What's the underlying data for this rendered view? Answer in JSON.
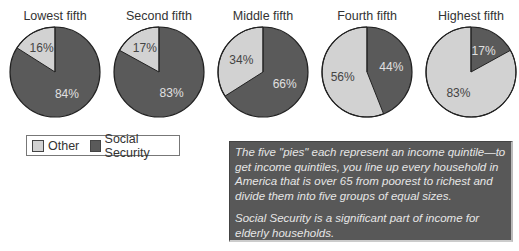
{
  "chart_data": {
    "type": "pie",
    "charts": [
      {
        "title": "Lowest fifth",
        "slices": [
          {
            "label": "Other",
            "value": 16
          },
          {
            "label": "Social Security",
            "value": 84
          }
        ]
      },
      {
        "title": "Second fifth",
        "slices": [
          {
            "label": "Other",
            "value": 17
          },
          {
            "label": "Social Security",
            "value": 83
          }
        ]
      },
      {
        "title": "Middle fifth",
        "slices": [
          {
            "label": "Other",
            "value": 34
          },
          {
            "label": "Social Security",
            "value": 66
          }
        ]
      },
      {
        "title": "Fourth fifth",
        "slices": [
          {
            "label": "Other",
            "value": 56
          },
          {
            "label": "Social Security",
            "value": 44
          }
        ]
      },
      {
        "title": "Highest fifth",
        "slices": [
          {
            "label": "Other",
            "value": 83
          },
          {
            "label": "Social Security",
            "value": 17
          }
        ]
      }
    ],
    "legend": [
      {
        "label": "Other",
        "color": "#d2d2d2"
      },
      {
        "label": "Social Security",
        "color": "#5a5a5a"
      }
    ],
    "legend_position": "bottom-left"
  },
  "titles": [
    "Lowest fifth",
    "Second fifth",
    "Middle fifth",
    "Fourth fifth",
    "Highest fifth"
  ],
  "legend": {
    "other": "Other",
    "social_security": "Social Security"
  },
  "note": {
    "p1": "The five \"pies\" each represent an income quintile—to get income quintiles, you line up every household in America that is over 65 from poorest to richest and divide them into five groups of equal sizes.",
    "p2": "Social Security is a significant part of income for elderly households."
  }
}
